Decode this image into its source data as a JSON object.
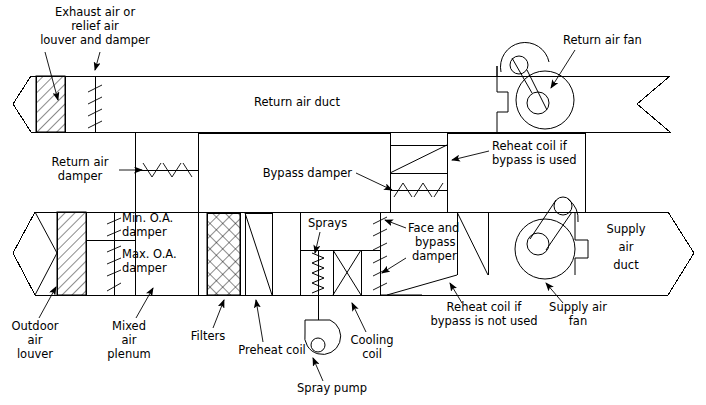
{
  "diagram": {
    "type": "hvac-schematic",
    "canvas": {
      "width": 706,
      "height": 405
    },
    "line_color": "#000000",
    "background_color": "#ffffff"
  },
  "labels": {
    "exhaust_louver": "Exhaust air or\nrelief air\nlouver and damper",
    "exhaust_louver_l1": "Exhaust air or",
    "exhaust_louver_l2": "relief air",
    "exhaust_louver_l3": "louver and damper",
    "return_air_fan": "Return air fan",
    "return_air_duct": "Return air duct",
    "return_air_damper_l1": "Return air",
    "return_air_damper_l2": "damper",
    "bypass_damper": "Bypass damper",
    "reheat_used_l1": "Reheat coil if",
    "reheat_used_l2": "bypass is used",
    "min_oa_damper_l1": "Min. O.A.",
    "min_oa_damper_l2": "damper",
    "max_oa_damper_l1": "Max. O.A.",
    "max_oa_damper_l2": "damper",
    "sprays": "Sprays",
    "face_bypass_l1": "Face and",
    "face_bypass_l2": "bypass",
    "face_bypass_l3": "damper",
    "supply_air_duct_l1": "Supply",
    "supply_air_duct_l2": "air",
    "supply_air_duct_l3": "duct",
    "outdoor_louver_l1": "Outdoor",
    "outdoor_louver_l2": "air",
    "outdoor_louver_l3": "louver",
    "mixed_plenum_l1": "Mixed",
    "mixed_plenum_l2": "air",
    "mixed_plenum_l3": "plenum",
    "filters": "Filters",
    "preheat_coil": "Preheat coil",
    "spray_pump": "Spray pump",
    "cooling_coil_l1": "Cooling",
    "cooling_coil_l2": "coil",
    "reheat_not_used_l1": "Reheat coil if",
    "reheat_not_used_l2": "bypass is not used",
    "supply_air_fan_l1": "Supply air",
    "supply_air_fan_l2": "fan"
  },
  "components": [
    {
      "name": "exhaust-air-louver",
      "kind": "louver-hatched"
    },
    {
      "name": "exhaust-air-damper",
      "kind": "damper-blades"
    },
    {
      "name": "return-air-duct",
      "kind": "duct"
    },
    {
      "name": "return-air-fan",
      "kind": "centrifugal-fan"
    },
    {
      "name": "return-air-damper",
      "kind": "damper-blades"
    },
    {
      "name": "bypass-section",
      "kind": "plenum"
    },
    {
      "name": "bypass-damper",
      "kind": "damper-blades"
    },
    {
      "name": "reheat-coil-bypass-used",
      "kind": "coil"
    },
    {
      "name": "outdoor-air-louver",
      "kind": "louver-hatched"
    },
    {
      "name": "min-oa-damper",
      "kind": "damper-blades"
    },
    {
      "name": "max-oa-damper",
      "kind": "damper-blades"
    },
    {
      "name": "mixed-air-plenum",
      "kind": "plenum"
    },
    {
      "name": "filters",
      "kind": "filter-crosshatch"
    },
    {
      "name": "preheat-coil",
      "kind": "coil"
    },
    {
      "name": "sprays",
      "kind": "spray-zigzag"
    },
    {
      "name": "cooling-coil",
      "kind": "coil-x"
    },
    {
      "name": "face-and-bypass-damper",
      "kind": "damper-blades"
    },
    {
      "name": "spray-pump",
      "kind": "pump"
    },
    {
      "name": "reheat-coil-bypass-not-used",
      "kind": "coil"
    },
    {
      "name": "supply-air-fan",
      "kind": "centrifugal-fan"
    },
    {
      "name": "supply-air-duct",
      "kind": "duct"
    }
  ]
}
